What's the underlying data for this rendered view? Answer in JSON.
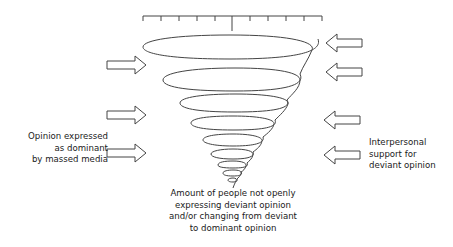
{
  "diagram": {
    "type": "spiral-of-silence",
    "colors": {
      "stroke": "#444444",
      "text": "#1a1a1a",
      "background": "#ffffff"
    },
    "scale": {
      "tick_count": 11,
      "center_tick_emphasized": true
    },
    "spiral": {
      "loop_count": 9,
      "direction": "narrowing-downward"
    },
    "left_arrows": {
      "count": 3,
      "direction": "right",
      "icon": "outline-arrow-right"
    },
    "right_arrows": {
      "count": 4,
      "direction": "left",
      "icon": "outline-arrow-left"
    },
    "labels": {
      "left": {
        "lines": [
          "Opinion expressed",
          "as dominant",
          "by massed media"
        ]
      },
      "right": {
        "lines": [
          "Interpersonal",
          "support for",
          "deviant opinion"
        ]
      },
      "bottom": {
        "lines": [
          "Amount of people not openly",
          "expressing deviant opinion",
          "and/or changing from deviant",
          "to dominant opinion"
        ]
      }
    }
  }
}
